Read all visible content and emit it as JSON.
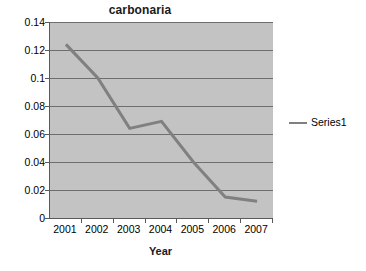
{
  "chart_data": {
    "type": "line",
    "title": "carbonaria",
    "xlabel": "Year",
    "ylabel": "",
    "categories": [
      "2001",
      "2002",
      "2003",
      "2004",
      "2005",
      "2006",
      "2007"
    ],
    "series": [
      {
        "name": "Series1",
        "values": [
          0.124,
          0.1,
          0.064,
          0.069,
          0.04,
          0.015,
          0.012
        ],
        "color": "#808080"
      }
    ],
    "ylim": [
      0,
      0.14
    ],
    "y_ticks": [
      0,
      0.02,
      0.04,
      0.06,
      0.08,
      0.1,
      0.12,
      0.14
    ],
    "y_tick_labels": [
      "0",
      "0.02",
      "0.04",
      "0.06",
      "0.08",
      "0.1",
      "0.12",
      "0.14"
    ],
    "grid": true,
    "grid_orientation": "horizontal",
    "legend_position": "right",
    "plot_background": "#c3c3c3",
    "gridline_color": "#6e6e6e",
    "axis_color": "#595959",
    "chart_background": "#ffffff"
  },
  "legend": {
    "entries": [
      {
        "label": "Series1",
        "swatch_name": "series1-line-swatch"
      }
    ]
  }
}
